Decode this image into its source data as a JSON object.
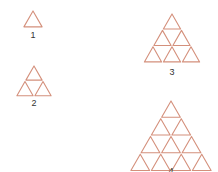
{
  "diagram": {
    "stroke_color": "#d4907c",
    "figures": [
      {
        "label": "1",
        "rows": 1,
        "apex": [
          33,
          10
        ],
        "side": 20,
        "label_pos": [
          33,
          35
        ]
      },
      {
        "label": "2",
        "rows": 2,
        "apex": [
          34,
          65
        ],
        "side": 36,
        "label_pos": [
          34,
          103
        ]
      },
      {
        "label": "3",
        "rows": 3,
        "apex": [
          172,
          13
        ],
        "side": 57,
        "label_pos": [
          172,
          72
        ]
      },
      {
        "label": "4",
        "rows": 4,
        "apex": [
          171,
          100
        ],
        "side": 82,
        "label_pos": [
          171,
          171
        ]
      }
    ]
  }
}
